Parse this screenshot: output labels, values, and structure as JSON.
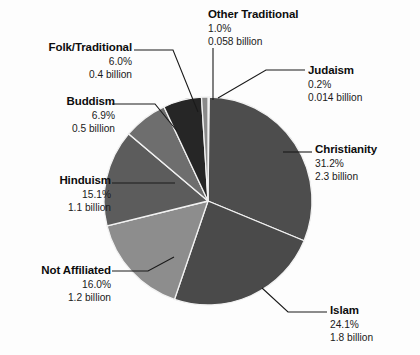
{
  "chart_data": {
    "type": "pie",
    "title": "",
    "subtitle": "",
    "legend_position": "callout-labels",
    "grid": false,
    "units": "billion",
    "start_angle_deg": -90,
    "direction": "clockwise",
    "categories": [
      "Judaism",
      "Christianity",
      "Islam",
      "Not Affiliated",
      "Hinduism",
      "Buddism",
      "Folk/Traditional",
      "Other Traditional"
    ],
    "values": [
      0.2,
      31.2,
      24.1,
      16.0,
      15.1,
      6.9,
      6.0,
      1.0
    ],
    "absolute_values": [
      0.014,
      2.3,
      1.8,
      1.2,
      1.1,
      0.5,
      0.4,
      0.058
    ],
    "slice_colors": [
      "#9a9a9a",
      "#4d4d4d",
      "#4a4a4a",
      "#8d8d8d",
      "#5c5c5c",
      "#6e6e6e",
      "#262626",
      "#8a8a8a"
    ],
    "slice_border_color": "#f2f2f2",
    "slices": [
      {
        "label": "Judaism",
        "percent_text": "0.2%",
        "value_text": "0.014 billion",
        "percent": 0.2,
        "value": 0.014,
        "color": "#9a9a9a"
      },
      {
        "label": "Christianity",
        "percent_text": "31.2%",
        "value_text": "2.3 billion",
        "percent": 31.2,
        "value": 2.3,
        "color": "#4d4d4d"
      },
      {
        "label": "Islam",
        "percent_text": "24.1%",
        "value_text": "1.8 billion",
        "percent": 24.1,
        "value": 1.8,
        "color": "#4a4a4a"
      },
      {
        "label": "Not Affiliated",
        "percent_text": "16.0%",
        "value_text": "1.2 billion",
        "percent": 16.0,
        "value": 1.2,
        "color": "#8d8d8d"
      },
      {
        "label": "Hinduism",
        "percent_text": "15.1%",
        "value_text": "1.1 billion",
        "percent": 15.1,
        "value": 1.1,
        "color": "#5c5c5c"
      },
      {
        "label": "Buddism",
        "percent_text": "6.9%",
        "value_text": "0.5 billion",
        "percent": 6.9,
        "value": 0.5,
        "color": "#6e6e6e"
      },
      {
        "label": "Folk/Traditional",
        "percent_text": "6.0%",
        "value_text": "0.4 billion",
        "percent": 6.0,
        "value": 0.4,
        "color": "#262626"
      },
      {
        "label": "Other Traditional",
        "percent_text": "1.0%",
        "value_text": "0.058 billion",
        "percent": 1.0,
        "value": 0.058,
        "color": "#8a8a8a"
      }
    ]
  },
  "labels": {
    "other_traditional": {
      "title": "Other Traditional",
      "percent": "1.0%",
      "amount": "0.058 billion"
    },
    "folk_traditional": {
      "title": "Folk/Traditional",
      "percent": "6.0%",
      "amount": "0.4 billion"
    },
    "buddism": {
      "title": "Buddism",
      "percent": "6.9%",
      "amount": "0.5 billion"
    },
    "hinduism": {
      "title": "Hinduism",
      "percent": "15.1%",
      "amount": "1.1 billion"
    },
    "not_affiliated": {
      "title": "Not Affiliated",
      "percent": "16.0%",
      "amount": "1.2 billion"
    },
    "judaism": {
      "title": "Judaism",
      "percent": "0.2%",
      "amount": "0.014 billion"
    },
    "christianity": {
      "title": "Christianity",
      "percent": "31.2%",
      "amount": "2.3 billion"
    },
    "islam": {
      "title": "Islam",
      "percent": "24.1%",
      "amount": "1.8 billion"
    }
  },
  "geometry": {
    "center_x": 208,
    "center_y": 201,
    "radius": 104
  },
  "colors": {
    "background": "#fdfdfd",
    "text": "#111111",
    "leader_line": "#1a1a1a"
  }
}
